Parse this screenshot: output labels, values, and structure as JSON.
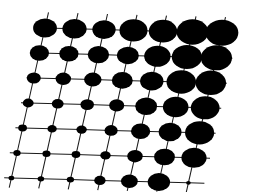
{
  "figure": {
    "title": "",
    "background_color": "#ffffff",
    "ink_color": "#000000",
    "line_color": "#1a1a1a"
  },
  "chart_data": {
    "type": "scatter",
    "subtype": "bubble-matrix-on-sheared-lattice",
    "title": "",
    "subtitle": "",
    "xlabel": "",
    "ylabel": "",
    "grid": true,
    "legend": null,
    "legend_position": "none",
    "marker_shape": "ellipse",
    "marker_color": "#000000",
    "size_encoding": "Marker area encodes magnitude; smallest at bottom-left, largest at top-right.",
    "n_rows": 7,
    "n_cols": 7,
    "row_labels": [
      "r1",
      "r2",
      "r3",
      "r4",
      "r5",
      "r6",
      "r7"
    ],
    "col_labels": [
      "c1",
      "c2",
      "c3",
      "c4",
      "c5",
      "c6",
      "c7"
    ],
    "x": [
      1,
      2,
      3,
      4,
      5,
      6,
      7
    ],
    "y": [
      1,
      2,
      3,
      4,
      5,
      6,
      7
    ],
    "value_range": [
      0.02,
      1.0
    ],
    "values": [
      [
        0.52,
        0.54,
        0.5,
        0.72,
        0.74,
        0.92,
        0.98
      ],
      [
        0.34,
        0.34,
        0.42,
        0.44,
        0.64,
        0.84,
        0.9
      ],
      [
        0.18,
        0.22,
        0.28,
        0.4,
        0.5,
        0.8,
        0.86
      ],
      [
        0.11,
        0.13,
        0.17,
        0.21,
        0.44,
        0.6,
        0.76
      ],
      [
        0.07,
        0.08,
        0.1,
        0.16,
        0.34,
        0.48,
        0.78
      ],
      [
        0.05,
        0.06,
        0.07,
        0.1,
        0.22,
        0.4,
        0.58
      ],
      [
        0.03,
        0.04,
        0.05,
        0.12,
        0.26,
        0.46,
        0.02
      ]
    ],
    "geometry": {
      "origin_x": 45,
      "origin_y": 28,
      "col_step_x": 29.5,
      "col_step_y": 0.8,
      "row_step_x": -5.6,
      "row_step_y": 25.0,
      "stub_length": 16,
      "description": "Sheared parallelogram lattice; columns run left-to-right with slight downward tilt, rows run top-to-bottom leaning left."
    }
  }
}
